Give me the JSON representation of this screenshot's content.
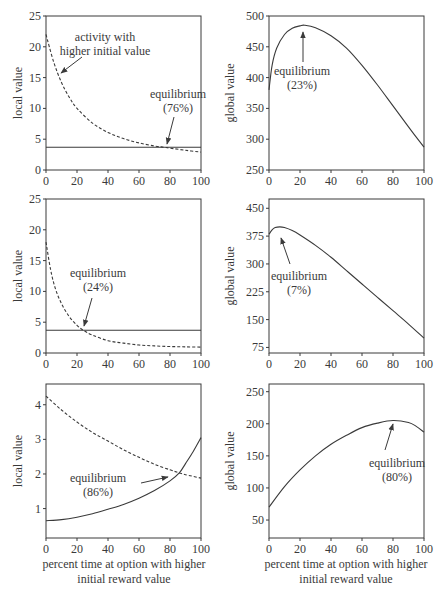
{
  "chart_data": [
    {
      "id": "top-left",
      "type": "line",
      "ylabel": "local value",
      "xlim": [
        0,
        100
      ],
      "ylim": [
        0,
        25
      ],
      "xticks": [
        0,
        20,
        40,
        60,
        80,
        100
      ],
      "yticks": [
        0,
        5,
        10,
        15,
        20,
        25
      ],
      "box": {
        "x0": 46,
        "x1": 201,
        "y0": 16,
        "y1": 170
      },
      "series": [
        {
          "name": "activity with higher initial value",
          "style": "dashed",
          "x": [
            0,
            5,
            10,
            15,
            20,
            30,
            40,
            50,
            60,
            70,
            76,
            80,
            90,
            100
          ],
          "y": [
            22,
            17.5,
            14.2,
            11.8,
            10.0,
            7.6,
            6.1,
            5.1,
            4.4,
            3.9,
            3.7,
            3.55,
            3.2,
            2.9
          ]
        },
        {
          "name": "activity with lower initial value",
          "style": "solid",
          "x": [
            0,
            100
          ],
          "y": [
            3.7,
            3.7
          ]
        }
      ],
      "annotations": [
        {
          "text": [
            "activity with",
            "higher initial value"
          ],
          "tx": 105,
          "ty": 41,
          "ax0": 82,
          "ay0": 57,
          "ax1": 61,
          "ay1": 73
        },
        {
          "text": [
            "equilibrium",
            "(76%)"
          ],
          "tx": 178,
          "ty": 98,
          "ax0": 174,
          "ay0": 117,
          "ax1": 167,
          "ay1": 144
        }
      ],
      "equilibrium_percent": 76
    },
    {
      "id": "top-right",
      "type": "line",
      "ylabel": "global value",
      "xlim": [
        0,
        100
      ],
      "ylim": [
        250,
        500
      ],
      "xticks": [
        0,
        20,
        40,
        60,
        80,
        100
      ],
      "yticks": [
        250,
        300,
        350,
        400,
        450,
        500
      ],
      "box": {
        "x0": 269,
        "x1": 424,
        "y0": 16,
        "y1": 170
      },
      "series": [
        {
          "name": "global value",
          "style": "solid",
          "x": [
            0,
            2,
            5,
            10,
            15,
            20,
            23,
            30,
            40,
            50,
            60,
            70,
            80,
            90,
            100
          ],
          "y": [
            380,
            420,
            448,
            470,
            480,
            484,
            485,
            481,
            468,
            448,
            420,
            388,
            354,
            320,
            287
          ]
        }
      ],
      "annotations": [
        {
          "text": [
            "equilibrium",
            "(23%)"
          ],
          "tx": 302,
          "ty": 75,
          "ax0": 303,
          "ay0": 62,
          "ax1": 303,
          "ay1": 32
        }
      ],
      "equilibrium_percent": 23
    },
    {
      "id": "middle-left",
      "type": "line",
      "ylabel": "local value",
      "xlim": [
        0,
        100
      ],
      "ylim": [
        0,
        25
      ],
      "xticks": [
        0,
        20,
        40,
        60,
        80,
        100
      ],
      "yticks": [
        0,
        5,
        10,
        15,
        20,
        25
      ],
      "box": {
        "x0": 46,
        "x1": 201,
        "y0": 199,
        "y1": 353
      },
      "series": [
        {
          "name": "activity with higher initial value",
          "style": "dashed",
          "x": [
            0,
            3,
            6,
            10,
            15,
            20,
            24,
            30,
            40,
            50,
            60,
            70,
            80,
            90,
            100
          ],
          "y": [
            18,
            13.5,
            10.5,
            8.0,
            5.9,
            4.5,
            3.7,
            2.9,
            2.0,
            1.6,
            1.3,
            1.15,
            1.05,
            1.0,
            0.95
          ]
        },
        {
          "name": "activity with lower initial value",
          "style": "solid",
          "x": [
            0,
            100
          ],
          "y": [
            3.7,
            3.7
          ]
        }
      ],
      "annotations": [
        {
          "text": [
            "equilibrium",
            "(24%)"
          ],
          "tx": 98,
          "ty": 277,
          "ax0": 92,
          "ay0": 298,
          "ax1": 84,
          "ay1": 326
        }
      ],
      "equilibrium_percent": 24
    },
    {
      "id": "middle-right",
      "type": "line",
      "ylabel": "global value",
      "xlim": [
        0,
        100
      ],
      "ylim": [
        60,
        475
      ],
      "xticks": [
        0,
        20,
        40,
        60,
        80,
        100
      ],
      "yticks": [
        75,
        150,
        225,
        300,
        375,
        450
      ],
      "box": {
        "x0": 269,
        "x1": 424,
        "y0": 199,
        "y1": 353
      },
      "series": [
        {
          "name": "global value",
          "style": "solid",
          "x": [
            0,
            2,
            4,
            7,
            10,
            15,
            20,
            30,
            40,
            50,
            60,
            70,
            80,
            90,
            100
          ],
          "y": [
            380,
            392,
            398,
            400,
            398,
            390,
            378,
            350,
            318,
            282,
            246,
            210,
            174,
            138,
            100
          ]
        }
      ],
      "annotations": [
        {
          "text": [
            "equilibrium",
            "(7%)"
          ],
          "tx": 299,
          "ty": 280,
          "ax0": 290,
          "ay0": 264,
          "ax1": 281,
          "ay1": 238
        }
      ],
      "equilibrium_percent": 7
    },
    {
      "id": "bottom-left",
      "type": "line",
      "ylabel": "local value",
      "xlabel": "percent time at option with higher initial reward value",
      "xlim": [
        0,
        100
      ],
      "ylim": [
        0.15,
        4.6
      ],
      "xticks": [
        0,
        20,
        40,
        60,
        80,
        100
      ],
      "yticks": [
        1,
        2,
        3,
        4
      ],
      "box": {
        "x0": 46,
        "x1": 201,
        "y0": 384,
        "y1": 538
      },
      "series": [
        {
          "name": "activity with higher initial value",
          "style": "dashed",
          "x": [
            0,
            10,
            20,
            30,
            40,
            50,
            60,
            70,
            80,
            86,
            90,
            100
          ],
          "y": [
            4.25,
            3.85,
            3.5,
            3.2,
            2.95,
            2.7,
            2.48,
            2.28,
            2.12,
            2.03,
            1.98,
            1.88
          ]
        },
        {
          "name": "activity with lower initial value",
          "style": "solid",
          "x": [
            0,
            10,
            20,
            30,
            40,
            50,
            60,
            70,
            80,
            86,
            90,
            95,
            100
          ],
          "y": [
            0.65,
            0.68,
            0.75,
            0.85,
            0.98,
            1.12,
            1.3,
            1.52,
            1.8,
            2.03,
            2.3,
            2.65,
            3.05
          ]
        }
      ],
      "annotations": [
        {
          "text": [
            "equilibrium",
            "(86%)"
          ],
          "tx": 98,
          "ty": 482,
          "ax0": 141,
          "ay0": 483,
          "ax1": 168,
          "ay1": 477
        }
      ],
      "equilibrium_percent": 86
    },
    {
      "id": "bottom-right",
      "type": "line",
      "ylabel": "global value",
      "xlabel": "percent time at option with higher initial reward value",
      "xlim": [
        0,
        100
      ],
      "ylim": [
        22,
        262
      ],
      "xticks": [
        0,
        20,
        40,
        60,
        80,
        100
      ],
      "yticks": [
        50,
        100,
        150,
        200,
        250
      ],
      "box": {
        "x0": 269,
        "x1": 424,
        "y0": 384,
        "y1": 538
      },
      "series": [
        {
          "name": "global value",
          "style": "solid",
          "x": [
            0,
            10,
            20,
            30,
            40,
            50,
            60,
            70,
            80,
            90,
            95,
            100
          ],
          "y": [
            70,
            102,
            128,
            150,
            168,
            182,
            194,
            201,
            205,
            202,
            196,
            187
          ]
        }
      ],
      "annotations": [
        {
          "text": [
            "equilibrium",
            "(80%)"
          ],
          "tx": 397,
          "ty": 467,
          "ax0": 385,
          "ay0": 450,
          "ax1": 393,
          "ay1": 424
        }
      ],
      "equilibrium_percent": 80
    }
  ],
  "axis_labels": {
    "bottom_left_x": [
      "percent time at option with higher",
      "initial reward value"
    ],
    "bottom_right_x": [
      "percent time at option with higher",
      "initial reward value"
    ]
  }
}
